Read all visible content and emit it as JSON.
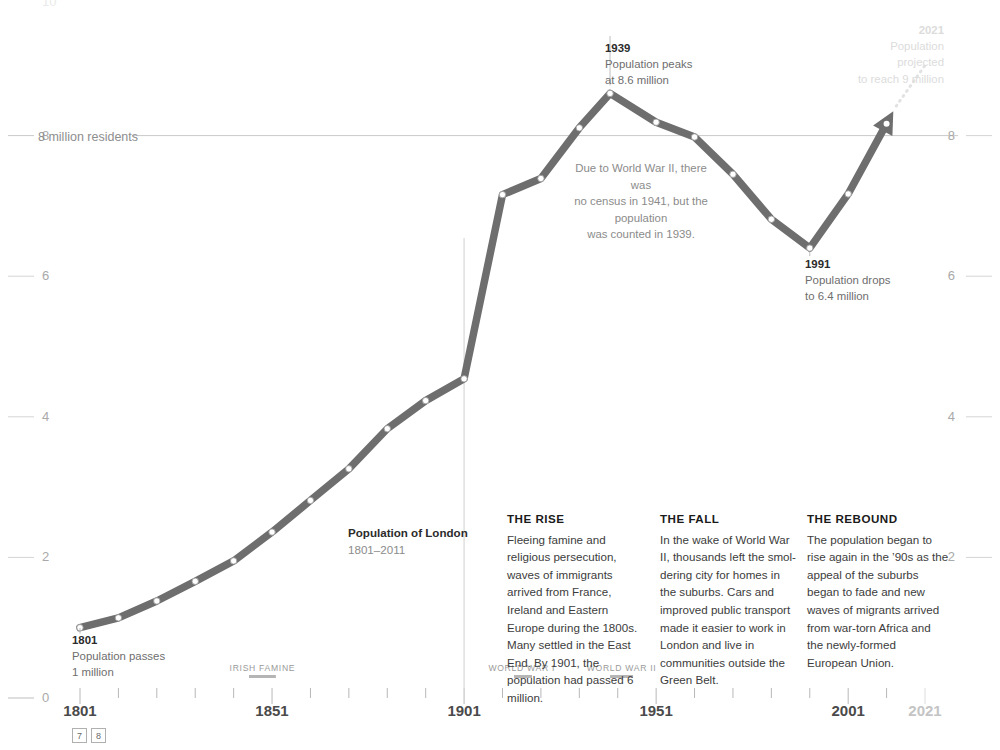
{
  "chart_data": {
    "type": "line",
    "title": "Population of London",
    "subtitle": "1801–2011",
    "xlabel": "",
    "ylabel": "",
    "xlim": [
      1801,
      2021
    ],
    "ylim": [
      0,
      10
    ],
    "grid": false,
    "legend": "none",
    "series": [
      {
        "name": "Population of London (millions)",
        "x": [
          1801,
          1811,
          1821,
          1831,
          1841,
          1851,
          1861,
          1871,
          1881,
          1891,
          1901,
          1911,
          1921,
          1931,
          1939,
          1951,
          1961,
          1971,
          1981,
          1991,
          2001,
          2011
        ],
        "values": [
          1.0,
          1.14,
          1.38,
          1.66,
          1.95,
          2.36,
          2.81,
          3.26,
          3.83,
          4.23,
          4.54,
          7.16,
          7.39,
          8.11,
          8.6,
          8.19,
          7.98,
          7.45,
          6.81,
          6.4,
          7.17,
          8.17
        ]
      },
      {
        "name": "Projection to 2021",
        "style": "dotted",
        "x": [
          2011,
          2021
        ],
        "values": [
          8.17,
          9.0
        ]
      }
    ],
    "y_ticks_left": [
      "0",
      "2",
      "4",
      "6",
      "8",
      "10"
    ],
    "y_ticks_right": [
      "2",
      "4",
      "6",
      "8"
    ],
    "x_ticks": [
      "1801",
      "1851",
      "1901",
      "1951",
      "2001",
      "2021"
    ],
    "reference_line": {
      "value": 8,
      "label": "8 million residents"
    }
  },
  "axis": {
    "y_left": [
      {
        "label": "10",
        "value": 10
      },
      {
        "label": "8",
        "value": 8
      },
      {
        "label": "6",
        "value": 6
      },
      {
        "label": "4",
        "value": 4
      },
      {
        "label": "2",
        "value": 2
      },
      {
        "label": "0",
        "value": 0
      }
    ],
    "y_right": [
      {
        "label": "8",
        "value": 8
      },
      {
        "label": "6",
        "value": 6
      },
      {
        "label": "4",
        "value": 4
      },
      {
        "label": "2",
        "value": 2
      }
    ],
    "x_years": [
      {
        "label": "1801",
        "value": 1801,
        "faded": false
      },
      {
        "label": "1851",
        "value": 1851,
        "faded": false
      },
      {
        "label": "1901",
        "value": 1901,
        "faded": false
      },
      {
        "label": "1951",
        "value": 1951,
        "faded": false
      },
      {
        "label": "2001",
        "value": 2001,
        "faded": false
      },
      {
        "label": "2021",
        "value": 2021,
        "faded": true
      }
    ],
    "reference_label": "8 million residents"
  },
  "title": {
    "main": "Population of London",
    "range": "1801–2011"
  },
  "annotations": {
    "first": {
      "year": "1801",
      "line1": "Population passes",
      "line2": "1 million"
    },
    "peak": {
      "year": "1939",
      "line1": "Population peaks",
      "line2": "at 8.6 million"
    },
    "trough": {
      "year": "1991",
      "line1": "Population drops",
      "line2": "to 6.4 million"
    },
    "projection": {
      "year": "2021",
      "line1": "Population projected",
      "line2": "to reach 9 million"
    },
    "census_note": {
      "line1": "Due to World War II, there was",
      "line2": "no census in 1941, but the population",
      "line3": "was counted in 1939."
    }
  },
  "eras": [
    {
      "name": "IRISH FAMINE",
      "start": 1845,
      "end": 1852
    },
    {
      "name": "WORLD WAR I",
      "start": 1914,
      "end": 1918
    },
    {
      "name": "WORLD WAR II",
      "start": 1939,
      "end": 1945
    }
  ],
  "columns": [
    {
      "heading": "THE RISE",
      "body": "Fleeing famine and religious persecution, waves of immigrants arrived from France, Ireland and Eastern Europe during the 1800s. Many settled in the East End. By 1901, the population had passed 6 million."
    },
    {
      "heading": "THE FALL",
      "body": "In the wake of World War II, thousands left the smol-dering city for homes in the suburbs. Cars and improved public transport made it easier to work in London and live in communities outside the Green Belt."
    },
    {
      "heading": "THE REBOUND",
      "body": "The population began to rise again in the ’90s as the appeal of the suburbs began to fade and new waves of migrants arrived from war-torn Africa and the newly-formed European Union."
    }
  ],
  "pager": {
    "prev": "7",
    "next": "8"
  },
  "colors": {
    "line": "#6e6e6e",
    "axis_text": "#a9a9a9",
    "body_text": "#3c3c3c",
    "faint": "#dcdcdc"
  }
}
